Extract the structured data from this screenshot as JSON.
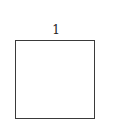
{
  "diagram": {
    "shape": "square",
    "side_label": "1",
    "stroke_color": "#3a3a3a",
    "label_color": "#222222"
  }
}
